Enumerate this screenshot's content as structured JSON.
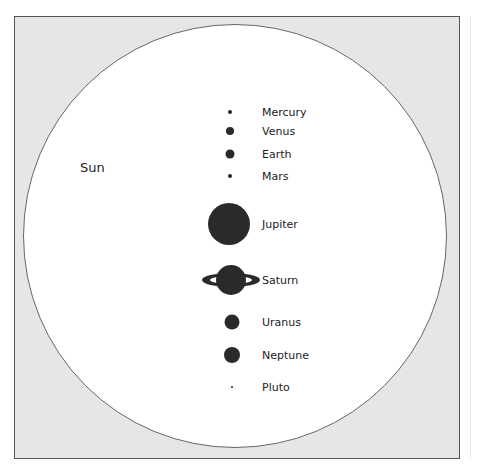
{
  "sun": {
    "label": "Sun"
  },
  "planets": [
    {
      "name": "Mercury",
      "cx": 230,
      "cy": 112,
      "d": 4
    },
    {
      "name": "Venus",
      "cx": 230,
      "cy": 131,
      "d": 8
    },
    {
      "name": "Earth",
      "cx": 230,
      "cy": 154,
      "d": 9
    },
    {
      "name": "Mars",
      "cx": 230,
      "cy": 176,
      "d": 4
    },
    {
      "name": "Jupiter",
      "cx": 229,
      "cy": 224,
      "d": 42
    },
    {
      "name": "Saturn",
      "cx": 231,
      "cy": 280,
      "d": 30
    },
    {
      "name": "Uranus",
      "cx": 232,
      "cy": 322,
      "d": 15
    },
    {
      "name": "Neptune",
      "cx": 232,
      "cy": 355,
      "d": 16
    },
    {
      "name": "Pluto",
      "cx": 232,
      "cy": 387,
      "d": 2
    }
  ],
  "label_x": 262,
  "colors": {
    "frame_bg": "#e6e6e6",
    "planet": "#2a2a2a",
    "sun": "#ffffff"
  }
}
